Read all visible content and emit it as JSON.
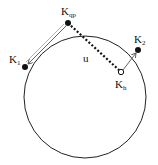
{
  "labels": {
    "kqp": {
      "main": "K",
      "sub": "qp"
    },
    "k1": {
      "main": "K",
      "sub": "1"
    },
    "k2": {
      "main": "K",
      "sub": "2"
    },
    "kh": {
      "main": "K",
      "sub": "h"
    },
    "u": "u"
  },
  "colors": {
    "stroke": "#222222",
    "arrow": "#555555",
    "background": "#ffffff"
  }
}
